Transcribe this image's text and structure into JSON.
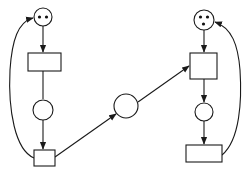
{
  "diagram": {
    "type": "petri-net",
    "colors": {
      "stroke": "#1a1a1a",
      "background": "#ffffff",
      "token": "#111111"
    },
    "places": [
      {
        "id": "p1",
        "cx": 43,
        "cy": 17,
        "r": 9,
        "tokens": 2
      },
      {
        "id": "p2",
        "cx": 43,
        "cy": 110,
        "r": 10,
        "tokens": 0
      },
      {
        "id": "p3",
        "cx": 126,
        "cy": 106,
        "r": 12,
        "tokens": 0
      },
      {
        "id": "p4",
        "cx": 204,
        "cy": 20,
        "r": 10,
        "tokens": 3
      },
      {
        "id": "p5",
        "cx": 204,
        "cy": 112,
        "r": 9,
        "tokens": 0
      }
    ],
    "transitions": [
      {
        "id": "t1",
        "x": 28,
        "y": 53,
        "w": 33,
        "h": 18
      },
      {
        "id": "t2",
        "x": 34,
        "y": 150,
        "w": 21,
        "h": 16
      },
      {
        "id": "t3",
        "x": 190,
        "y": 53,
        "w": 27,
        "h": 26
      },
      {
        "id": "t4",
        "x": 186,
        "y": 145,
        "w": 36,
        "h": 17
      }
    ],
    "arcs": [
      {
        "from": "p1",
        "to": "t1"
      },
      {
        "from": "t1",
        "to": "p2"
      },
      {
        "from": "p2",
        "to": "t2"
      },
      {
        "from": "t2",
        "to": "p1",
        "curved": true
      },
      {
        "from": "t2",
        "to": "p3"
      },
      {
        "from": "p3",
        "to": "t3"
      },
      {
        "from": "p4",
        "to": "t3"
      },
      {
        "from": "t3",
        "to": "p5"
      },
      {
        "from": "p5",
        "to": "t4"
      },
      {
        "from": "t4",
        "to": "p4",
        "curved": true
      }
    ]
  }
}
